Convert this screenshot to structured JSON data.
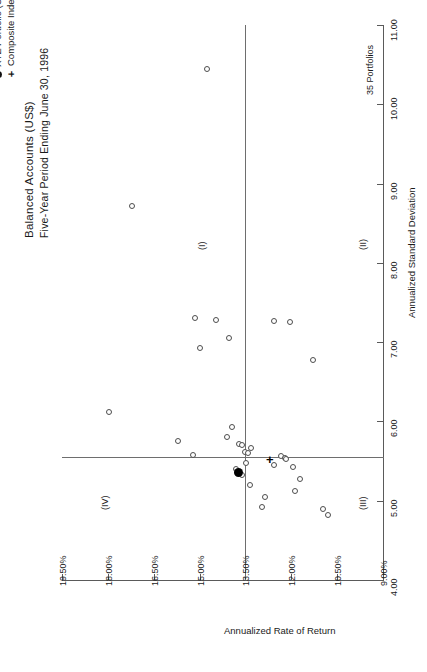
{
  "title": {
    "main": "Balanced Accounts (US$)",
    "sub": "Five-Year Period Ending June 30, 1996"
  },
  "legend": {
    "items": [
      {
        "marker": "filled-circle",
        "label": "XYZ Portfolio (US$)"
      },
      {
        "marker": "plus",
        "label": "Composite Index (US$)"
      }
    ]
  },
  "count_label": "35 Portfolios",
  "quadrants": [
    {
      "id": "I",
      "label": "(I)"
    },
    {
      "id": "II",
      "label": "(II)"
    },
    {
      "id": "III",
      "label": "(III)"
    },
    {
      "id": "IV",
      "label": "(IV)"
    }
  ],
  "chart_data": {
    "type": "scatter",
    "title": "Balanced Accounts (US$)",
    "subtitle": "Five-Year Period Ending June 30, 1996",
    "xlabel": "Annualized Standard Deviation",
    "ylabel": "Annualized Rate of Return",
    "xlim": [
      4.0,
      11.0
    ],
    "ylim": [
      9.0,
      19.5
    ],
    "xticks": [
      "4.00",
      "5.00",
      "6.00",
      "7.00",
      "8.00",
      "9.00",
      "10.00",
      "11.00"
    ],
    "yticks": [
      "9.00%",
      "10.50%",
      "12.00%",
      "13.50%",
      "15.00%",
      "16.50%",
      "18.00%",
      "19.50%"
    ],
    "grid": false,
    "legend_position": "top-left",
    "orientation": "rotated-90-cw",
    "median_lines": {
      "x": 5.55,
      "y": 13.5
    },
    "n_portfolios": 35,
    "series": [
      {
        "name": "Universe portfolios",
        "marker": "open-circle",
        "points": [
          {
            "x": 10.45,
            "y": 14.75
          },
          {
            "x": 8.72,
            "y": 17.2
          },
          {
            "x": 7.3,
            "y": 15.15
          },
          {
            "x": 7.28,
            "y": 14.45
          },
          {
            "x": 7.05,
            "y": 14.05
          },
          {
            "x": 6.93,
            "y": 15.0
          },
          {
            "x": 7.27,
            "y": 12.55
          },
          {
            "x": 7.25,
            "y": 12.05
          },
          {
            "x": 6.78,
            "y": 11.3
          },
          {
            "x": 6.12,
            "y": 17.95
          },
          {
            "x": 5.93,
            "y": 13.95
          },
          {
            "x": 5.8,
            "y": 14.1
          },
          {
            "x": 5.72,
            "y": 13.7
          },
          {
            "x": 5.7,
            "y": 13.62
          },
          {
            "x": 5.66,
            "y": 13.32
          },
          {
            "x": 5.62,
            "y": 13.52
          },
          {
            "x": 5.6,
            "y": 13.42
          },
          {
            "x": 5.58,
            "y": 15.2
          },
          {
            "x": 5.56,
            "y": 12.35
          },
          {
            "x": 5.54,
            "y": 12.22
          },
          {
            "x": 5.52,
            "y": 12.18
          },
          {
            "x": 5.48,
            "y": 13.48
          },
          {
            "x": 5.45,
            "y": 12.55
          },
          {
            "x": 5.42,
            "y": 11.95
          },
          {
            "x": 5.4,
            "y": 13.8
          },
          {
            "x": 5.33,
            "y": 13.6
          },
          {
            "x": 5.28,
            "y": 11.7
          },
          {
            "x": 5.2,
            "y": 13.35
          },
          {
            "x": 5.12,
            "y": 11.88
          },
          {
            "x": 5.05,
            "y": 12.85
          },
          {
            "x": 4.92,
            "y": 12.95
          },
          {
            "x": 4.9,
            "y": 10.95
          },
          {
            "x": 4.82,
            "y": 10.8
          },
          {
            "x": 5.75,
            "y": 15.7
          }
        ]
      },
      {
        "name": "XYZ Portfolio (US$)",
        "marker": "filled-circle",
        "points": [
          {
            "x": 5.35,
            "y": 13.72
          }
        ]
      },
      {
        "name": "Composite Index (US$)",
        "marker": "plus",
        "points": [
          {
            "x": 5.52,
            "y": 12.7
          }
        ]
      }
    ]
  }
}
